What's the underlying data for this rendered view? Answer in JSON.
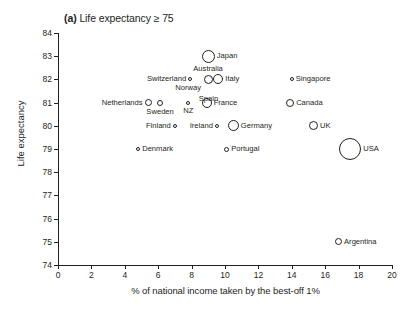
{
  "figure": {
    "panel_tag": "(a)",
    "panel_title": "Life expectancy ≥ 75",
    "xlabel": "% of national income taken by the best-off 1%",
    "ylabel": "Life expectancy"
  },
  "chart_data": {
    "type": "scatter",
    "title": "(a) Life expectancy ≥ 75",
    "xlabel": "% of national income taken by the best-off 1%",
    "ylabel": "Life expectancy",
    "xlim": [
      0,
      20
    ],
    "ylim": [
      74,
      84
    ],
    "xticks": [
      0,
      2,
      4,
      6,
      8,
      10,
      12,
      14,
      16,
      18,
      20
    ],
    "yticks": [
      74,
      75,
      76,
      77,
      78,
      79,
      80,
      81,
      82,
      83,
      84
    ],
    "grid": false,
    "legend": "none",
    "marker": "open-circle, size proportional to population",
    "color": "#231f20",
    "points": [
      {
        "label": "Japan",
        "x": 9.0,
        "y": 83.0,
        "size": 13,
        "label_pos": "right"
      },
      {
        "label": "Australia",
        "x": 9.0,
        "y": 82.0,
        "size": 9,
        "label_pos": "above"
      },
      {
        "label": "Switzerland",
        "x": 7.9,
        "y": 82.0,
        "size": 4,
        "label_pos": "left"
      },
      {
        "label": "Italy",
        "x": 9.6,
        "y": 82.0,
        "size": 10,
        "label_pos": "right"
      },
      {
        "label": "Spain",
        "x": 9.0,
        "y": 81.5,
        "size": 0,
        "label_pos": "below"
      },
      {
        "label": "Norway",
        "x": 7.8,
        "y": 81.3,
        "size": 0,
        "label_pos": "above"
      },
      {
        "label": "Netherlands",
        "x": 5.4,
        "y": 81.0,
        "size": 7,
        "label_pos": "left"
      },
      {
        "label": "Sweden",
        "x": 6.1,
        "y": 81.0,
        "size": 6,
        "label_pos": "below"
      },
      {
        "label": "NZ",
        "x": 7.8,
        "y": 81.0,
        "size": 4,
        "label_pos": "below"
      },
      {
        "label": "France",
        "x": 8.9,
        "y": 81.0,
        "size": 10,
        "label_pos": "right"
      },
      {
        "label": "Singapore",
        "x": 14.0,
        "y": 82.0,
        "size": 4,
        "label_pos": "right"
      },
      {
        "label": "Canada",
        "x": 13.9,
        "y": 81.0,
        "size": 8,
        "label_pos": "right"
      },
      {
        "label": "Finland",
        "x": 7.0,
        "y": 80.0,
        "size": 4,
        "label_pos": "left"
      },
      {
        "label": "Ireland",
        "x": 9.5,
        "y": 80.0,
        "size": 4,
        "label_pos": "left"
      },
      {
        "label": "Germany",
        "x": 10.5,
        "y": 80.0,
        "size": 11,
        "label_pos": "right"
      },
      {
        "label": "UK",
        "x": 15.3,
        "y": 80.0,
        "size": 9,
        "label_pos": "right"
      },
      {
        "label": "Denmark",
        "x": 4.8,
        "y": 79.0,
        "size": 4,
        "label_pos": "right"
      },
      {
        "label": "Portugal",
        "x": 10.1,
        "y": 79.0,
        "size": 5,
        "label_pos": "right"
      },
      {
        "label": "USA",
        "x": 17.5,
        "y": 79.0,
        "size": 22,
        "label_pos": "right"
      },
      {
        "label": "Argentina",
        "x": 16.8,
        "y": 75.0,
        "size": 7,
        "label_pos": "right"
      }
    ]
  }
}
